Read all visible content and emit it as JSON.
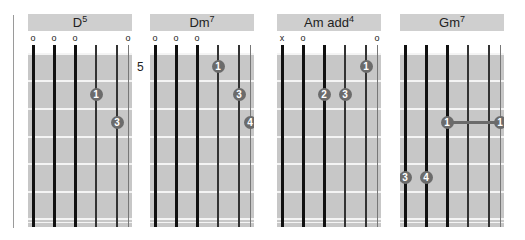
{
  "colors": {
    "header_bg": "#cfcfcf",
    "grid_bg": "#c7c7c7",
    "dot": "#6b6b6b",
    "string": "#111111"
  },
  "chords": [
    {
      "name": "D",
      "superscript": "5",
      "left": 28,
      "markers": [
        "o",
        "o",
        "o",
        "",
        "",
        "o"
      ],
      "start_fret_label": "",
      "fingers": [
        {
          "string": 4,
          "fret": 2,
          "finger": "1"
        },
        {
          "string": 5,
          "fret": 3,
          "finger": "3"
        }
      ],
      "barre": null
    },
    {
      "name": "Dm",
      "superscript": "7",
      "left": 150,
      "markers": [
        "o",
        "o",
        "o",
        "",
        "",
        ""
      ],
      "start_fret_label": "5",
      "fingers": [
        {
          "string": 4,
          "fret": 1,
          "finger": "1"
        },
        {
          "string": 5,
          "fret": 2,
          "finger": "3"
        },
        {
          "string": 6,
          "fret": 3,
          "finger": "4"
        }
      ],
      "barre": null
    },
    {
      "name": "Am add",
      "superscript": "4",
      "left": 277,
      "markers": [
        "x",
        "o",
        "",
        "",
        "",
        "o"
      ],
      "start_fret_label": "",
      "fingers": [
        {
          "string": 5,
          "fret": 1,
          "finger": "1"
        },
        {
          "string": 3,
          "fret": 2,
          "finger": "2"
        },
        {
          "string": 4,
          "fret": 2,
          "finger": "3"
        }
      ],
      "barre": null
    },
    {
      "name": "Gm",
      "superscript": "7",
      "left": 400,
      "markers": [
        "",
        "",
        "",
        "",
        "",
        ""
      ],
      "start_fret_label": "",
      "fingers": [
        {
          "string": 3,
          "fret": 3,
          "finger": "1"
        },
        {
          "string": 6,
          "fret": 3,
          "finger": "1"
        },
        {
          "string": 1,
          "fret": 5,
          "finger": "3"
        },
        {
          "string": 2,
          "fret": 5,
          "finger": "4"
        }
      ],
      "barre": {
        "from_string": 3,
        "to_string": 6,
        "fret": 3
      }
    }
  ]
}
